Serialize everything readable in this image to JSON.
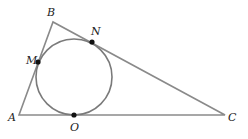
{
  "diagram": {
    "colors": {
      "line": "#8a8a8a",
      "circle": "#7a7a7a",
      "point": "#111111",
      "label": "#222222"
    },
    "vertices": [
      {
        "id": "A",
        "label": "A",
        "x": 19,
        "y": 115,
        "lx": 8,
        "ly": 121
      },
      {
        "id": "B",
        "label": "B",
        "x": 53,
        "y": 22,
        "lx": 47,
        "ly": 16
      },
      {
        "id": "C",
        "label": "C",
        "x": 225,
        "y": 115,
        "lx": 228,
        "ly": 121
      }
    ],
    "circle": {
      "cx": 74,
      "cy": 77,
      "r": 38
    },
    "tangent_points": [
      {
        "id": "M",
        "label": "M",
        "x": 38,
        "y": 62,
        "lx": 26,
        "ly": 64
      },
      {
        "id": "N",
        "label": "N",
        "x": 92,
        "y": 42,
        "lx": 91,
        "ly": 35
      },
      {
        "id": "O",
        "label": "O",
        "x": 74,
        "y": 115,
        "lx": 70,
        "ly": 131
      }
    ]
  }
}
